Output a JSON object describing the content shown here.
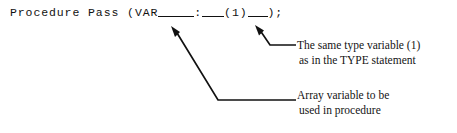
{
  "figure": {
    "background_color": "#ffffff",
    "ink_color": "#111111"
  },
  "code": {
    "keyword_procedure": "Procedure",
    "procedure_name": "Pass",
    "open_paren": "(",
    "var_keyword": "VAR",
    "blank_array_variable": "",
    "colon": ":",
    "blank_type_prefix": "",
    "type_index": "(1)",
    "blank_type_suffix": "",
    "close_paren": ")",
    "semicolon": ";",
    "full_line": "Procedure Pass (VAR____:___(1)__);"
  },
  "annotations": [
    {
      "id": "type-variable",
      "line1": "The same type variable (1)",
      "line2": "as in the TYPE statement",
      "points_to": "type_index"
    },
    {
      "id": "array-variable",
      "line1": "Array variable to be",
      "line2": "used in procedure",
      "points_to": "blank_array_variable"
    }
  ]
}
